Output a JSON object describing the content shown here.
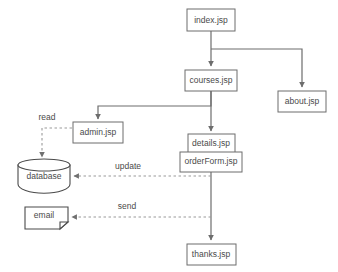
{
  "diagram": {
    "background_color": "#ffffff",
    "node_stroke_color": "#6d6d6d",
    "text_color": "#4a4a4a",
    "dashed_edge_color": "#9a9a9a",
    "nodes": [
      {
        "id": "index",
        "label": "index.jsp",
        "shape": "rect"
      },
      {
        "id": "courses",
        "label": "courses.jsp",
        "shape": "rect"
      },
      {
        "id": "about",
        "label": "about.jsp",
        "shape": "rect"
      },
      {
        "id": "admin",
        "label": "admin.jsp",
        "shape": "rect"
      },
      {
        "id": "details",
        "label": "details.jsp",
        "shape": "rect"
      },
      {
        "id": "orderForm",
        "label": "orderForm.jsp",
        "shape": "rect"
      },
      {
        "id": "thanks",
        "label": "thanks.jsp",
        "shape": "rect"
      },
      {
        "id": "database",
        "label": "database",
        "shape": "cylinder"
      },
      {
        "id": "email",
        "label": "email",
        "shape": "note"
      }
    ],
    "edges": [
      {
        "from": "index",
        "to": "courses",
        "style": "solid",
        "label": ""
      },
      {
        "from": "index",
        "to": "about",
        "style": "solid",
        "label": ""
      },
      {
        "from": "courses",
        "to": "admin",
        "style": "solid",
        "label": ""
      },
      {
        "from": "courses",
        "to": "details",
        "style": "solid",
        "label": ""
      },
      {
        "from": "admin",
        "to": "database",
        "style": "dashed",
        "label": "read"
      },
      {
        "from": "orderForm",
        "to": "database",
        "style": "dashed",
        "label": "update"
      },
      {
        "from": "orderForm",
        "to": "email",
        "style": "dashed",
        "label": "send"
      },
      {
        "from": "orderForm",
        "to": "thanks",
        "style": "solid",
        "label": ""
      }
    ],
    "edge_labels": {
      "read": "read",
      "update": "update",
      "send": "send"
    }
  }
}
